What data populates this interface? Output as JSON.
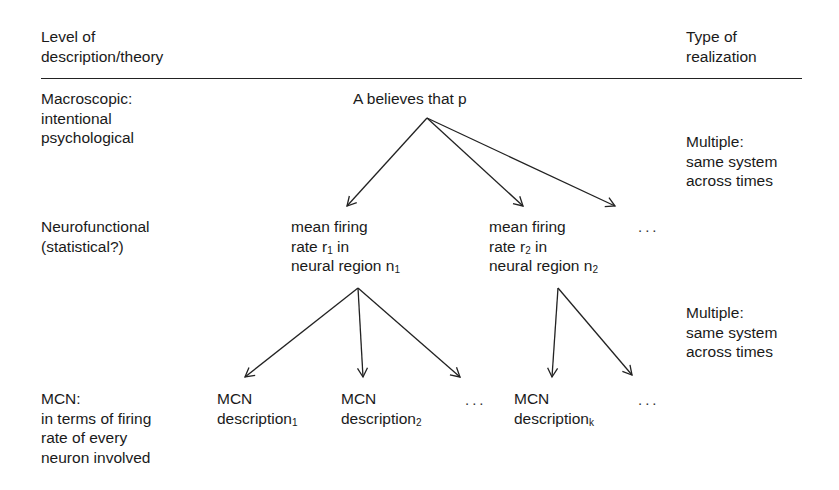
{
  "header": {
    "left": [
      "Level of",
      "description/theory"
    ],
    "right": [
      "Type of",
      "realization"
    ]
  },
  "levels": [
    {
      "name": "macroscopic",
      "lines": [
        "Macroscopic:",
        "intentional",
        "psychological"
      ]
    },
    {
      "name": "neurofunctional",
      "lines": [
        "Neurofunctional",
        "(statistical?)"
      ]
    },
    {
      "name": "mcn",
      "lines": [
        "MCN:",
        "in terms of firing",
        "rate of every",
        "neuron involved"
      ]
    }
  ],
  "realizations": [
    {
      "lines": [
        "Multiple:",
        "same system",
        "across times"
      ]
    },
    {
      "lines": [
        "Multiple:",
        "same system",
        "across times"
      ]
    }
  ],
  "nodes": {
    "root": "A believes that p",
    "neuro1": {
      "l1": "mean firing",
      "l2a": "rate r",
      "l2sub": "1",
      "l2b": " in",
      "l3a": "neural region n",
      "l3sub": "1"
    },
    "neuro2": {
      "l1": "mean firing",
      "l2a": "rate r",
      "l2sub": "2",
      "l2b": " in",
      "l3a": "neural region n",
      "l3sub": "2"
    },
    "mcn1": {
      "l1": "MCN",
      "l2a": "description",
      "l2sub": "1"
    },
    "mcn2": {
      "l1": "MCN",
      "l2a": "description",
      "l2sub": "2"
    },
    "mcnk": {
      "l1": "MCN",
      "l2a": "description",
      "l2sub": "k"
    }
  },
  "ellipsis": "..."
}
